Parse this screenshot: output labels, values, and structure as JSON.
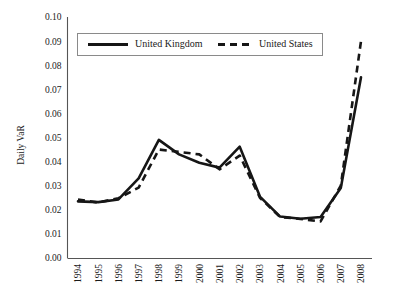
{
  "chart_data": {
    "type": "line",
    "title": "",
    "xlabel": "",
    "ylabel": "Daily VaR",
    "grid": false,
    "legend_position": "top-inside",
    "ylim": [
      0.0,
      0.1
    ],
    "ytick_step": 0.01,
    "ytick_labels": [
      "0.00",
      "0.01",
      "0.02",
      "0.03",
      "0.04",
      "0.05",
      "0.06",
      "0.07",
      "0.08",
      "0.09",
      "0.10"
    ],
    "categories": [
      "1994",
      "1995",
      "1996",
      "1997",
      "1998",
      "1999",
      "2000",
      "2001",
      "2002",
      "2003",
      "2004",
      "2005",
      "2006",
      "2007",
      "2008"
    ],
    "x": [
      1994,
      1995,
      1996,
      1997,
      1998,
      1999,
      2000,
      2001,
      2002,
      2003,
      2004,
      2005,
      2006,
      2007,
      2008
    ],
    "series": [
      {
        "name": "United Kingdom",
        "style": "solid",
        "color": "#161616",
        "values": [
          0.0235,
          0.0232,
          0.0243,
          0.033,
          0.049,
          0.043,
          0.0395,
          0.0375,
          0.0462,
          0.0255,
          0.0172,
          0.0163,
          0.017,
          0.029,
          0.075
        ]
      },
      {
        "name": "United States",
        "style": "dashed",
        "color": "#161616",
        "values": [
          0.0243,
          0.023,
          0.0248,
          0.0292,
          0.045,
          0.044,
          0.043,
          0.0368,
          0.0425,
          0.025,
          0.017,
          0.0162,
          0.0152,
          0.03,
          0.09
        ]
      }
    ]
  },
  "axis": {
    "y_title": "Daily VaR"
  },
  "legend": {
    "items": [
      {
        "label": "United Kingdom",
        "style": "solid"
      },
      {
        "label": "United States",
        "style": "dashed"
      }
    ]
  }
}
